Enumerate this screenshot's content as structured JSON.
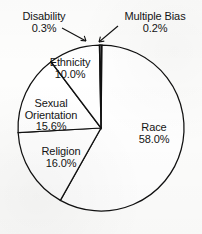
{
  "chart_data": {
    "type": "pie",
    "title": "",
    "subtitle": "",
    "xlabel": "",
    "ylabel": "",
    "legend_position": "none",
    "grid": false,
    "start_angle_deg": 0,
    "direction": "clockwise",
    "categories": [
      "Multiple Bias",
      "Race",
      "Religion",
      "Sexual Orientation",
      "Ethnicity",
      "Disability"
    ],
    "values": [
      0.2,
      58.0,
      16.0,
      15.6,
      10.0,
      0.3
    ],
    "units": "percent",
    "labels": [
      "Multiple Bias 0.2%",
      "Race 58.0%",
      "Religion 16.0%",
      "Sexual Orientation 15.6%",
      "Ethnicity 10.0%",
      "Disability 0.3%"
    ],
    "slices": [
      {
        "id": "multiple-bias",
        "name": "Multiple Bias",
        "value": 0.2,
        "value_text": "0.2%",
        "callout": true
      },
      {
        "id": "race",
        "name": "Race",
        "value": 58.0,
        "value_text": "58.0%",
        "callout": false
      },
      {
        "id": "religion",
        "name": "Religion",
        "value": 16.0,
        "value_text": "16.0%",
        "callout": false
      },
      {
        "id": "sexual-orientation",
        "name": "Sexual Orientation",
        "name_line1": "Sexual",
        "name_line2": "Orientation",
        "value": 15.6,
        "value_text": "15.6%",
        "callout": false
      },
      {
        "id": "ethnicity",
        "name": "Ethnicity",
        "value": 10.0,
        "value_text": "10.0%",
        "callout": false
      },
      {
        "id": "disability",
        "name": "Disability",
        "value": 0.3,
        "value_text": "0.3%",
        "callout": true
      }
    ]
  },
  "style": {
    "slice_fill": "#ffffff",
    "slice_stroke": "#111111",
    "text_color": "#141414",
    "background": "#fdfdfc"
  },
  "geometry": {
    "center_x": 101,
    "center_y": 128,
    "radius": 83
  }
}
